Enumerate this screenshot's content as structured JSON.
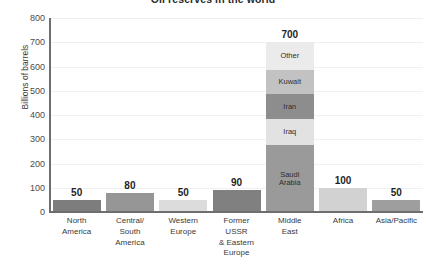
{
  "chart_data": {
    "type": "bar",
    "title": "Oil reserves in the world",
    "xlabel": "",
    "ylabel": "Billions of barrels",
    "ylim": [
      0,
      800
    ],
    "ytick_step": 100,
    "ytick_labels": [
      "800",
      "700",
      "600",
      "500",
      "400",
      "300",
      "200",
      "100",
      "0"
    ],
    "grid": true,
    "legend": "none",
    "categories": [
      "North America",
      "Central/ South America",
      "Western Europe",
      "Former USSR & Eastern Europe",
      "Middle East",
      "Africa",
      "Asia/Pacific"
    ],
    "values": [
      50,
      80,
      50,
      90,
      700,
      100,
      50
    ],
    "data_labels": [
      "50",
      "80",
      "50",
      "90",
      "700",
      "100",
      "50"
    ],
    "stacked_category": "Middle East",
    "stack_segments": [
      {
        "name": "Saudi Arabia",
        "value": 275,
        "color": "#9a9a9a"
      },
      {
        "name": "Iraq",
        "value": 110,
        "color": "#e2e2e2"
      },
      {
        "name": "Iran",
        "value": 100,
        "color": "#8d8d8d"
      },
      {
        "name": "Kuwait",
        "value": 100,
        "color": "#c2c2c2"
      },
      {
        "name": "Other",
        "value": 115,
        "color": "#ebebeb"
      }
    ],
    "bar_colors": [
      "#7d7d7d",
      "#969696",
      "#dcdcdc",
      "#808080",
      "#a3a3a3",
      "#d2d2d2",
      "#9e9e9e"
    ]
  },
  "axis": {
    "y_title": "Billions of barrels"
  },
  "categories_display": [
    [
      "North",
      "America"
    ],
    [
      "Central/",
      "South",
      "America"
    ],
    [
      "Western",
      "Europe"
    ],
    [
      "Former",
      "USSR",
      "& Eastern",
      "Europe"
    ],
    [
      "Middle",
      "East"
    ],
    [
      "Africa"
    ],
    [
      "Asia/Pacific"
    ]
  ]
}
